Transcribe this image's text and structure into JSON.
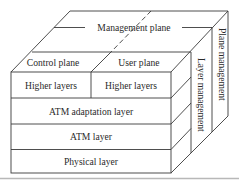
{
  "diagram": {
    "type": "ATM protocol reference model (3D cube)",
    "top_face": {
      "management_plane_label": "Management plane",
      "control_plane_label": "Control plane",
      "user_plane_label": "User plane"
    },
    "front_face": {
      "rows": [
        {
          "left": "Higher layers",
          "right": "Higher layers"
        },
        {
          "label": "ATM adaptation layer"
        },
        {
          "label": "ATM layer"
        },
        {
          "label": "Physical layer"
        }
      ]
    },
    "side_face": {
      "layer_management_label": "Layer management",
      "plane_management_label": "Plane management"
    },
    "colors": {
      "line": "#3a3a3a",
      "text": "#2a2a2a",
      "background": "#ffffff",
      "bottom_rule": "#b8b8b8"
    }
  }
}
